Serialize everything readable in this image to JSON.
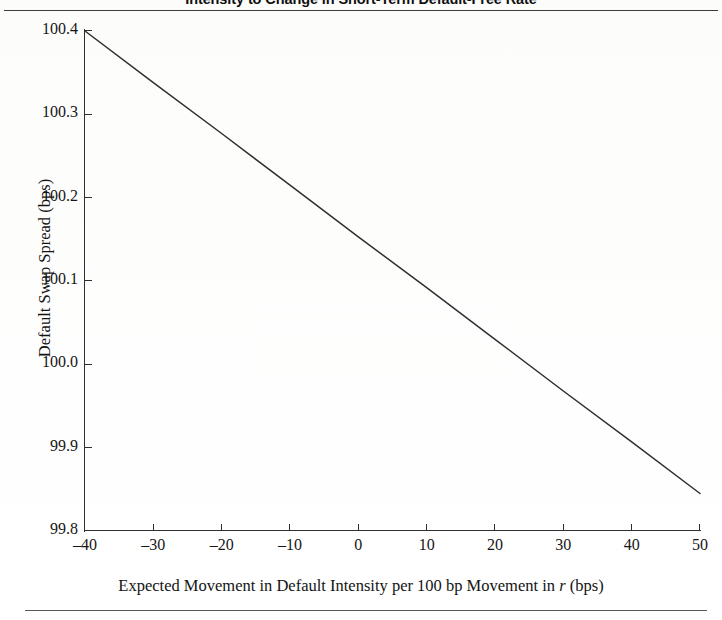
{
  "figure": {
    "title": "Intensity to Change in Short-Term Default-Free Rate",
    "background_color": "#ffffff",
    "line_color": "#2f2f2f",
    "axis_color": "#2f2f2f",
    "text_color": "#161616"
  },
  "chart_data": {
    "type": "line",
    "title": "Intensity to Change in Short-Term Default-Free Rate",
    "xlabel": "Expected Movement in Default Intensity per 100 bp Movement in r (bps)",
    "xlabel_parts": {
      "before": "Expected Movement in Default Intensity per 100 bp Movement in ",
      "variable": "r",
      "after": " (bps)"
    },
    "ylabel": "Default Swap Spread (bps)",
    "xlim": [
      -40,
      50
    ],
    "ylim": [
      99.8,
      100.4
    ],
    "xticks": [
      -40,
      -30,
      -20,
      -10,
      0,
      10,
      20,
      30,
      40,
      50
    ],
    "xticklabels": [
      "–40",
      "–30",
      "–20",
      "–10",
      "0",
      "10",
      "20",
      "30",
      "40",
      "50"
    ],
    "yticks": [
      99.8,
      99.9,
      100.0,
      100.1,
      100.2,
      100.3,
      100.4
    ],
    "yticklabels": [
      "99.8",
      "99.9",
      "100.0",
      "100.1",
      "100.2",
      "100.3",
      "100.4"
    ],
    "grid": false,
    "legend": null,
    "tick_direction": "in",
    "spines": [
      "left",
      "bottom"
    ],
    "series": [
      {
        "name": "Default Swap Spread",
        "x": [
          -40,
          -30,
          -20,
          -10,
          0,
          10,
          20,
          30,
          40,
          50
        ],
        "values": [
          100.4,
          100.338,
          100.277,
          100.215,
          100.153,
          100.092,
          100.03,
          99.968,
          99.907,
          99.845
        ]
      }
    ]
  }
}
